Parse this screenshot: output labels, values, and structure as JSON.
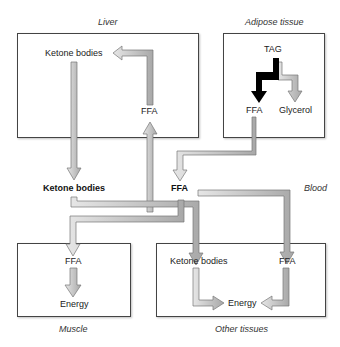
{
  "compartments": {
    "liver": "Liver",
    "adipose": "Adipose tissue",
    "blood": "Blood",
    "muscle": "Muscle",
    "other": "Other tissues"
  },
  "nodes": {
    "liver_ketone": "Ketone bodies",
    "liver_ffa": "FFA",
    "adipose_tag": "TAG",
    "adipose_ffa": "FFA",
    "adipose_glycerol": "Glycerol",
    "blood_ketone": "Ketone bodies",
    "blood_ffa": "FFA",
    "muscle_ffa": "FFA",
    "muscle_energy": "Energy",
    "other_ketone": "Ketone bodies",
    "other_ffa": "FFA",
    "other_energy": "Energy"
  },
  "colors": {
    "arrow_fill": "#b8b8b8",
    "arrow_stroke": "#777777",
    "lipolysis_arrow": "#000000",
    "box_border": "#444444"
  }
}
